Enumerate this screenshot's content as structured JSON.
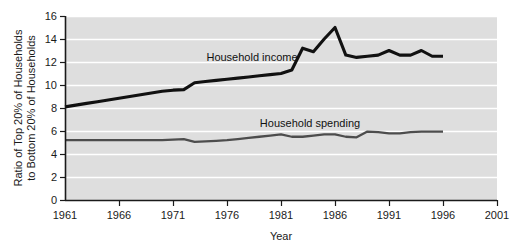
{
  "chart_data": {
    "type": "line",
    "title": "",
    "xlabel": "Year",
    "ylabel": "Ratio of Top 20% of Households to Bottom 20% of Households",
    "ylabel_line1": "Ratio of Top 20% of Households",
    "ylabel_line2": "to Bottom 20% of Households",
    "xlim": [
      1961,
      2001
    ],
    "ylim": [
      0,
      16
    ],
    "xticks": [
      1961,
      1966,
      1971,
      1976,
      1981,
      1986,
      1991,
      1996,
      2001
    ],
    "yticks": [
      0,
      2,
      4,
      6,
      8,
      10,
      12,
      14,
      16
    ],
    "grid": "horizontal-white-gridlines",
    "legend": "inline-labels",
    "plot_background": "#dedede",
    "gridline_color": "#ffffff",
    "axis_color": "#1a1a1a",
    "series": [
      {
        "name": "Household income",
        "color": "#111111",
        "label_x": 1981,
        "label_y": 13.0,
        "x": [
          1961,
          1962,
          1963,
          1964,
          1965,
          1966,
          1967,
          1968,
          1969,
          1970,
          1971,
          1972,
          1973,
          1974,
          1975,
          1976,
          1977,
          1978,
          1979,
          1980,
          1981,
          1982,
          1983,
          1984,
          1985,
          1986,
          1987,
          1988,
          1989,
          1990,
          1991,
          1992,
          1993,
          1994,
          1995,
          1996
        ],
        "values": [
          8.1,
          8.25,
          8.4,
          8.55,
          8.7,
          8.85,
          9.0,
          9.15,
          9.3,
          9.45,
          9.55,
          9.6,
          10.2,
          10.3,
          10.4,
          10.5,
          10.6,
          10.7,
          10.8,
          10.9,
          11.0,
          11.3,
          13.2,
          12.9,
          14.0,
          15.0,
          12.6,
          12.4,
          12.5,
          12.6,
          13.0,
          12.6,
          12.6,
          13.0,
          12.5,
          12.5
        ]
      },
      {
        "name": "Household spending",
        "color": "#4d4d4d",
        "label_x": 1983,
        "label_y": 7.3,
        "x": [
          1961,
          1962,
          1963,
          1964,
          1965,
          1966,
          1967,
          1968,
          1969,
          1970,
          1971,
          1972,
          1973,
          1974,
          1975,
          1976,
          1977,
          1978,
          1979,
          1980,
          1981,
          1982,
          1983,
          1984,
          1985,
          1986,
          1987,
          1988,
          1989,
          1990,
          1991,
          1992,
          1993,
          1994,
          1995,
          1996
        ],
        "values": [
          5.2,
          5.2,
          5.2,
          5.2,
          5.2,
          5.2,
          5.2,
          5.2,
          5.2,
          5.2,
          5.25,
          5.3,
          5.05,
          5.1,
          5.15,
          5.2,
          5.3,
          5.4,
          5.5,
          5.6,
          5.7,
          5.5,
          5.5,
          5.6,
          5.7,
          5.7,
          5.5,
          5.45,
          5.95,
          5.9,
          5.8,
          5.8,
          5.9,
          5.95,
          5.95,
          5.95
        ]
      }
    ]
  },
  "axis": {
    "x_title": "Year",
    "y_title_line1": "Ratio of Top 20% of Households",
    "y_title_line2": "to Bottom 20% of Households"
  },
  "labels": {
    "income": "Household income",
    "spending": "Household spending"
  }
}
